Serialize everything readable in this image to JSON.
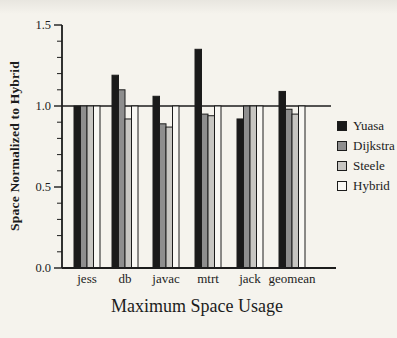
{
  "figure": {
    "background": "#f5f3ed",
    "ink": "#1c1c1c"
  },
  "chart_data": {
    "type": "bar",
    "title": "",
    "xlabel": "Maximum Space Usage",
    "ylabel": "Space Normalized to Hybrid",
    "categories": [
      "jess",
      "db",
      "javac",
      "mtrt",
      "jack",
      "geomean"
    ],
    "series": [
      {
        "name": "Yuasa",
        "color": "#1a1a1a",
        "values": [
          1.0,
          1.19,
          1.06,
          1.35,
          0.92,
          1.09
        ]
      },
      {
        "name": "Dijkstra",
        "color": "#8e8e8e",
        "values": [
          1.0,
          1.1,
          0.89,
          0.95,
          1.0,
          0.98
        ]
      },
      {
        "name": "Steele",
        "color": "#c7c6c2",
        "values": [
          1.0,
          0.92,
          0.87,
          0.94,
          1.0,
          0.95
        ]
      },
      {
        "name": "Hybrid",
        "color": "#f9f8f4",
        "values": [
          1.0,
          1.0,
          1.0,
          1.0,
          1.0,
          1.0
        ]
      }
    ],
    "ylim": [
      0,
      1.5
    ],
    "y_ticks": [
      0.0,
      0.5,
      1.0,
      1.5
    ],
    "y_minor_step": 0.1,
    "y_tick_decimals": 1,
    "reference_line": 1.0,
    "grid": false,
    "legend_position": "right"
  }
}
